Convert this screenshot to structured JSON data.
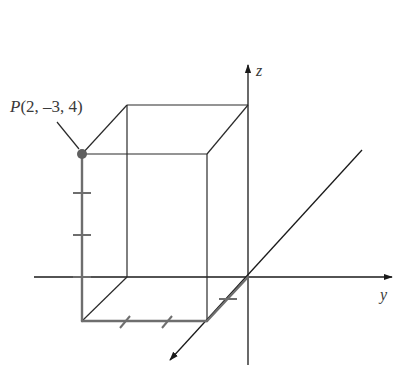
{
  "diagram": {
    "point_label": {
      "name": "P",
      "coords": "(2, –3, 4)"
    },
    "point": {
      "x": 2,
      "y": -3,
      "z": 4
    },
    "axes": {
      "x": "x",
      "y": "y",
      "z": "z"
    },
    "axis_labels_visible": {
      "y": "y",
      "z": "z"
    },
    "colors": {
      "axis": "#1a1a1a",
      "box": "#2a2a2a",
      "highlight": "#6e6e6e",
      "point": "#5f5f5f"
    },
    "ticks": {
      "x_axis_ticks": 1,
      "y_ticks": 2,
      "z_ticks": 3
    }
  }
}
